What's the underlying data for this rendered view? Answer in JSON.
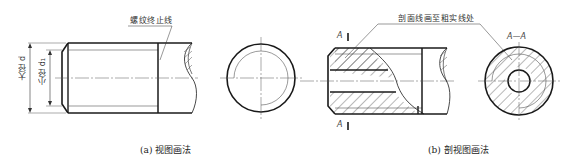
{
  "figure_a": {
    "caption": "(a) 视图画法",
    "callout": "螺纹终止线",
    "dim_major": "大径 d",
    "dim_minor": "小径 d₁"
  },
  "figure_b": {
    "caption": "(b) 剖视图画法",
    "callout": "剖面线画至粗实线处",
    "section_mark_top": "A",
    "section_mark_bottom": "A",
    "section_title": "A—A"
  },
  "colors": {
    "line": "#1a1a1a",
    "thin": "#555555",
    "background": "#ffffff"
  }
}
